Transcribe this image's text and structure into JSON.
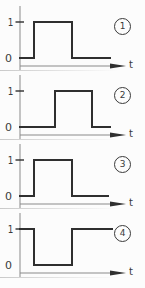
{
  "figure": {
    "background": "#fcfcfc",
    "ink_color": "#2f2f2f",
    "axis_color": "#8a8a8a",
    "labels": {
      "high": "1",
      "low": "0",
      "time": "t"
    },
    "panels": [
      {
        "badge": "1",
        "initial_level": 0,
        "segments": [
          [
            20,
            34,
            0
          ],
          [
            34,
            72,
            1
          ],
          [
            72,
            110,
            0
          ]
        ]
      },
      {
        "badge": "2",
        "initial_level": 0,
        "segments": [
          [
            20,
            55,
            0
          ],
          [
            55,
            92,
            1
          ],
          [
            92,
            110,
            0
          ]
        ]
      },
      {
        "badge": "3",
        "initial_level": 0,
        "segments": [
          [
            20,
            34,
            0
          ],
          [
            34,
            72,
            1
          ],
          [
            72,
            108,
            0
          ]
        ]
      },
      {
        "badge": "4",
        "initial_level": 1,
        "segments": [
          [
            20,
            34,
            1
          ],
          [
            34,
            72,
            0
          ],
          [
            72,
            112,
            1
          ]
        ]
      }
    ]
  }
}
